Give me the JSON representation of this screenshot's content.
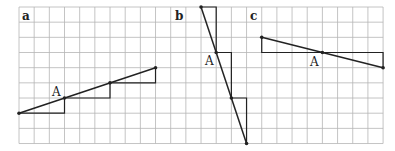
{
  "grid": {
    "origin_x": 19,
    "origin_y": 7,
    "cell": 15.17,
    "cols": 24,
    "rows": 9,
    "line_color": "#b5b5b5",
    "border_color": "#9a9a9a"
  },
  "stroke_color": "#222222",
  "panels": [
    {
      "id": "a",
      "label": "a",
      "label_pos": [
        22,
        20
      ],
      "point_label": "A",
      "point_label_pos": [
        52,
        96
      ],
      "segment": [
        [
          0,
          7
        ],
        [
          9,
          4
        ]
      ],
      "point_A": [
        3,
        6
      ],
      "steps": [
        [
          [
            0,
            7
          ],
          [
            3,
            7
          ],
          [
            3,
            6
          ]
        ],
        [
          [
            3,
            6
          ],
          [
            6,
            6
          ],
          [
            6,
            5
          ]
        ],
        [
          [
            6,
            5
          ],
          [
            9,
            5
          ],
          [
            9,
            4
          ]
        ]
      ],
      "marked_points": [
        [
          0,
          7
        ],
        [
          3,
          6
        ],
        [
          6,
          5
        ],
        [
          9,
          4
        ]
      ]
    },
    {
      "id": "b",
      "label": "b",
      "label_pos": [
        175,
        20
      ],
      "point_label": "A",
      "point_label_pos": [
        205,
        65
      ],
      "segment": [
        [
          12,
          0
        ],
        [
          15,
          9
        ]
      ],
      "point_A": [
        13,
        3
      ],
      "steps": [
        [
          [
            12,
            0
          ],
          [
            13,
            0
          ],
          [
            13,
            3
          ]
        ],
        [
          [
            13,
            3
          ],
          [
            14,
            3
          ],
          [
            14,
            6
          ]
        ],
        [
          [
            14,
            6
          ],
          [
            15,
            6
          ],
          [
            15,
            9
          ]
        ]
      ],
      "marked_points": [
        [
          12,
          0
        ],
        [
          13,
          3
        ],
        [
          14,
          6
        ],
        [
          15,
          9
        ]
      ]
    },
    {
      "id": "c",
      "label": "c",
      "label_pos": [
        250,
        20
      ],
      "point_label": "A",
      "point_label_pos": [
        310,
        66
      ],
      "segment": [
        [
          16,
          2
        ],
        [
          24,
          4
        ]
      ],
      "point_A": [
        20,
        3
      ],
      "steps": [
        [
          [
            16,
            2
          ],
          [
            16,
            3
          ],
          [
            20,
            3
          ]
        ],
        [
          [
            20,
            3
          ],
          [
            24,
            3
          ],
          [
            24,
            4
          ]
        ]
      ],
      "marked_points": [
        [
          16,
          2
        ],
        [
          20,
          3
        ],
        [
          24,
          4
        ]
      ]
    }
  ]
}
